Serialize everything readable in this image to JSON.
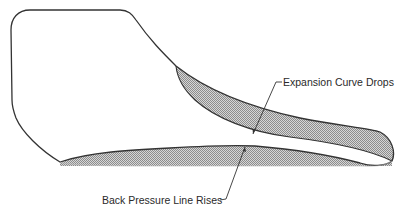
{
  "diagram": {
    "type": "pressure-volume indicator diagram",
    "annotations": [
      {
        "id": "expansion",
        "text": "Expansion Curve Drops"
      },
      {
        "id": "backpressure",
        "text": "Back Pressure Line Rises"
      }
    ],
    "colors": {
      "stroke": "#333333",
      "hatch": "#9a9a9a",
      "background": "#ffffff"
    },
    "regions": [
      {
        "name": "expansion-loss-area",
        "fill": "hatched"
      },
      {
        "name": "back-pressure-loss-area",
        "fill": "hatched"
      }
    ]
  }
}
